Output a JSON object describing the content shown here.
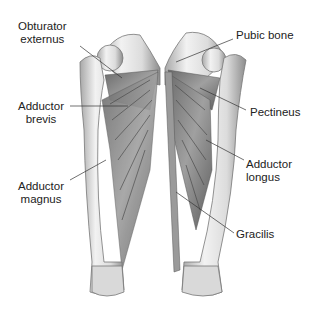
{
  "labels": {
    "obturator_externus": {
      "line1": "Obturator",
      "line2": "externus"
    },
    "adductor_brevis": {
      "line1": "Adductor",
      "line2": "brevis"
    },
    "adductor_magnus": {
      "line1": "Adductor",
      "line2": "magnus"
    },
    "pubic_bone": {
      "line1": "Pubic bone"
    },
    "pectineus": {
      "line1": "Pectineus"
    },
    "adductor_longus": {
      "line1": "Adductor",
      "line2": "longus"
    },
    "gracilis": {
      "line1": "Gracilis"
    }
  },
  "colors": {
    "bone": "#e6e6e6",
    "bone_shadow": "#9a9a9a",
    "muscle": "#8a8a8a",
    "muscle_dark": "#5a5a5a",
    "line": "#333333",
    "text": "#222222"
  }
}
